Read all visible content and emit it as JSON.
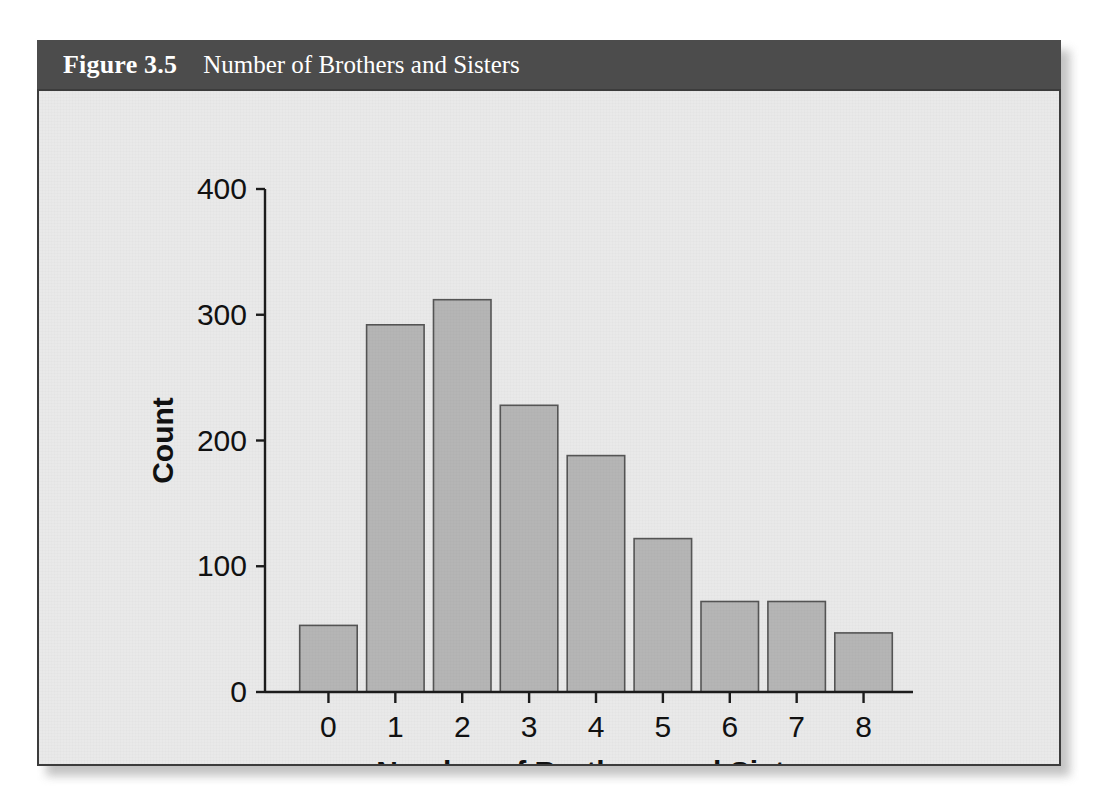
{
  "figure": {
    "number_label": "Figure 3.5",
    "caption": "Number of Brothers and Sisters"
  },
  "colors": {
    "caption_bar": "#4c4c4c",
    "caption_text": "#ffffff",
    "plate_background": "#e9e9e9",
    "plate_border": "#3c3c3c",
    "bar_fill": "#b5b5b5",
    "bar_stroke": "#555555",
    "axis_line": "#1c1c1c",
    "axis_text": "#111111"
  },
  "chart_data": {
    "type": "bar",
    "title": "Number of Brothers and Sisters",
    "xlabel": "Number of Brothers and Sisters",
    "ylabel": "Count",
    "categories": [
      "0",
      "1",
      "2",
      "3",
      "4",
      "5",
      "6",
      "7",
      "8"
    ],
    "values": [
      53,
      292,
      312,
      228,
      188,
      122,
      72,
      72,
      47
    ],
    "ylim": [
      0,
      400
    ],
    "yticks": [
      0,
      100,
      200,
      300,
      400
    ],
    "ytick_labels": [
      "0",
      "100",
      "200",
      "300",
      "400"
    ],
    "xtick_labels": [
      "0",
      "1",
      "2",
      "3",
      "4",
      "5",
      "6",
      "7",
      "8"
    ],
    "grid": false,
    "legend": false,
    "legend_position": "none"
  }
}
